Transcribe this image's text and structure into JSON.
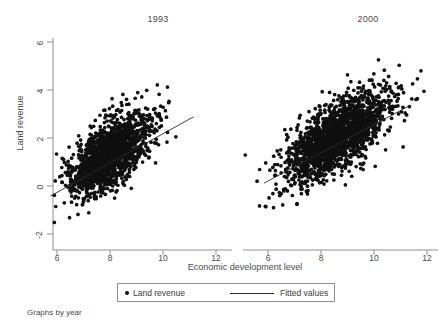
{
  "chart_data": {
    "type": "scatter",
    "title": "",
    "xlabel": "Economic development level",
    "ylabel": "Land revenue",
    "caption": "Graphs by year",
    "xlim": [
      5.3,
      12.3
    ],
    "ylim": [
      -2.9,
      6.4
    ],
    "xticks": [
      6,
      8,
      10,
      12
    ],
    "yticks": [
      -2,
      0,
      2,
      4,
      6
    ],
    "grid": false,
    "legend": {
      "position": "bottom-center",
      "entries": [
        {
          "label": "Land revenue",
          "marker": "filled-circle",
          "color": "#101010"
        },
        {
          "label": "Fitted values",
          "marker": "line",
          "color": "#2a2a2a"
        }
      ]
    },
    "panels": [
      {
        "name": "1993",
        "n_points": 1600,
        "x_mean": 7.95,
        "x_sd": 0.78,
        "y_mean": 1.28,
        "y_sd": 0.86,
        "correlation": 0.62,
        "fit_line": {
          "x0": 5.75,
          "y0": -0.42,
          "x1": 11.15,
          "y1": 2.88
        }
      },
      {
        "name": "2000",
        "n_points": 1900,
        "x_mean": 8.62,
        "x_sd": 0.93,
        "y_mean": 2.06,
        "y_sd": 0.95,
        "correlation": 0.68,
        "fit_line": {
          "x0": 5.85,
          "y0": 0.12,
          "x1": 11.35,
          "y1": 3.35
        }
      }
    ]
  },
  "panel_titles": {
    "left": "1993",
    "right": "2000"
  },
  "axes": {
    "ylabel": "Land revenue",
    "xlabel": "Economic development level",
    "ytick_labels": [
      "6",
      "4",
      "2",
      "0",
      "-2"
    ],
    "xtick_labels_left": [
      "6",
      "8",
      "10",
      "12"
    ],
    "xtick_labels_right": [
      "6",
      "8",
      "10",
      "12"
    ]
  },
  "legend": {
    "points_label": "Land revenue",
    "line_label": "Fitted values"
  },
  "caption": "Graphs by year",
  "colors": {
    "marker": "#101010",
    "line": "#2a2a2a",
    "axis": "#8f8f8f",
    "text": "#4a4a4a",
    "background": "#ffffff"
  }
}
